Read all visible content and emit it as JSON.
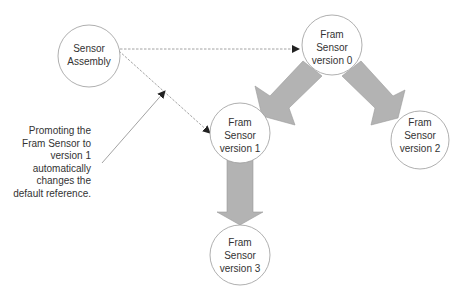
{
  "diagram": {
    "nodes": [
      {
        "id": "sensor-assembly",
        "lines": [
          "Sensor",
          "Assembly"
        ],
        "cx": 89,
        "cy": 56,
        "r": 31
      },
      {
        "id": "fram-v0",
        "lines": [
          "Fram",
          "Sensor",
          "version 0"
        ],
        "cx": 332,
        "cy": 45,
        "r": 30
      },
      {
        "id": "fram-v1",
        "lines": [
          "Fram",
          "Sensor",
          "version 1"
        ],
        "cx": 240,
        "cy": 133,
        "r": 30
      },
      {
        "id": "fram-v2",
        "lines": [
          "Fram",
          "Sensor",
          "version 2"
        ],
        "cx": 420,
        "cy": 140,
        "r": 29
      },
      {
        "id": "fram-v3",
        "lines": [
          "Fram",
          "Sensor",
          "version 3"
        ],
        "cx": 240,
        "cy": 255,
        "r": 30
      }
    ],
    "edges": [
      {
        "from": "sensor-assembly",
        "to": "fram-v0",
        "style": "dashed"
      },
      {
        "from": "sensor-assembly",
        "to": "fram-v1",
        "style": "dashed"
      },
      {
        "from": "fram-v0",
        "to": "fram-v1",
        "style": "block-arrow"
      },
      {
        "from": "fram-v0",
        "to": "fram-v2",
        "style": "block-arrow"
      },
      {
        "from": "fram-v1",
        "to": "fram-v3",
        "style": "block-arrow"
      }
    ],
    "annotation": {
      "lines": [
        "Promoting the",
        "Fram Sensor to",
        "version 1",
        "automatically",
        "changes the",
        "default reference."
      ],
      "points_to": "dashed edge sensor-assembly → fram-v1"
    },
    "colors": {
      "block_arrow_fill": "#b3b3b3",
      "block_arrow_stroke": "#9a9a9a",
      "node_stroke": "#9a9a9a",
      "line": "#8a8a8a",
      "text": "#333333"
    }
  }
}
